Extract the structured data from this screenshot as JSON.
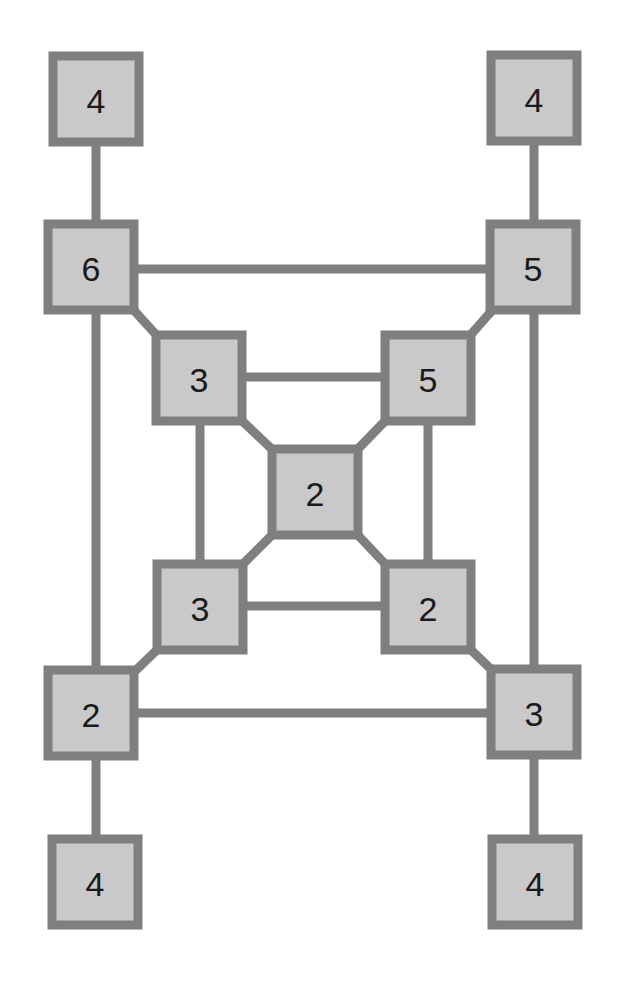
{
  "diagram": {
    "type": "graph",
    "colors": {
      "node_fill": "#c9c9c9",
      "node_border": "#7f7f7f",
      "edge": "#7f7f7f",
      "label": "#1a1a1a",
      "background": "#ffffff"
    },
    "node_size": 86,
    "nodes": [
      {
        "id": "n_tl",
        "label": "4",
        "x": 53,
        "y": 56
      },
      {
        "id": "n_tr",
        "label": "4",
        "x": 491,
        "y": 55
      },
      {
        "id": "n_o6",
        "label": "6",
        "x": 48,
        "y": 224
      },
      {
        "id": "n_o5",
        "label": "5",
        "x": 490,
        "y": 224
      },
      {
        "id": "n_i3a",
        "label": "3",
        "x": 156,
        "y": 335
      },
      {
        "id": "n_i5",
        "label": "5",
        "x": 385,
        "y": 335
      },
      {
        "id": "n_c",
        "label": "2",
        "x": 272,
        "y": 449
      },
      {
        "id": "n_i3b",
        "label": "3",
        "x": 157,
        "y": 564
      },
      {
        "id": "n_i2",
        "label": "2",
        "x": 385,
        "y": 564
      },
      {
        "id": "n_o2",
        "label": "2",
        "x": 48,
        "y": 670
      },
      {
        "id": "n_o3",
        "label": "3",
        "x": 491,
        "y": 669
      },
      {
        "id": "n_bl",
        "label": "4",
        "x": 52,
        "y": 839
      },
      {
        "id": "n_br",
        "label": "4",
        "x": 492,
        "y": 839
      }
    ],
    "edges": [
      {
        "from": "n_tl",
        "to": "n_o6",
        "x1": 96,
        "y1": 142,
        "x2": 96,
        "y2": 224
      },
      {
        "from": "n_tr",
        "to": "n_o5",
        "x1": 534,
        "y1": 141,
        "x2": 534,
        "y2": 224
      },
      {
        "from": "n_o6",
        "to": "n_o5",
        "x1": 134,
        "y1": 269,
        "x2": 490,
        "y2": 269
      },
      {
        "from": "n_o6",
        "to": "n_o2",
        "x1": 96,
        "y1": 310,
        "x2": 96,
        "y2": 670
      },
      {
        "from": "n_o5",
        "to": "n_o3",
        "x1": 534,
        "y1": 310,
        "x2": 534,
        "y2": 669
      },
      {
        "from": "n_o2",
        "to": "n_o3",
        "x1": 134,
        "y1": 713,
        "x2": 491,
        "y2": 713
      },
      {
        "from": "n_o2",
        "to": "n_bl",
        "x1": 96,
        "y1": 756,
        "x2": 96,
        "y2": 839
      },
      {
        "from": "n_o3",
        "to": "n_br",
        "x1": 534,
        "y1": 755,
        "x2": 534,
        "y2": 839
      },
      {
        "from": "n_o6",
        "to": "n_i3a",
        "x1": 130,
        "y1": 306,
        "x2": 160,
        "y2": 339
      },
      {
        "from": "n_o5",
        "to": "n_i5",
        "x1": 496,
        "y1": 306,
        "x2": 467,
        "y2": 339
      },
      {
        "from": "n_o2",
        "to": "n_i3b",
        "x1": 130,
        "y1": 676,
        "x2": 161,
        "y2": 646
      },
      {
        "from": "n_o3",
        "to": "n_i2",
        "x1": 497,
        "y1": 675,
        "x2": 467,
        "y2": 646
      },
      {
        "from": "n_i3a",
        "to": "n_i5",
        "x1": 242,
        "y1": 377,
        "x2": 385,
        "y2": 377
      },
      {
        "from": "n_i3b",
        "to": "n_i2",
        "x1": 243,
        "y1": 606,
        "x2": 385,
        "y2": 606
      },
      {
        "from": "n_i3a",
        "to": "n_i3b",
        "x1": 200,
        "y1": 421,
        "x2": 200,
        "y2": 564
      },
      {
        "from": "n_i5",
        "to": "n_i2",
        "x1": 428,
        "y1": 421,
        "x2": 428,
        "y2": 564
      },
      {
        "from": "n_i3a",
        "to": "n_c",
        "x1": 238,
        "y1": 417,
        "x2": 276,
        "y2": 453
      },
      {
        "from": "n_i5",
        "to": "n_c",
        "x1": 389,
        "y1": 417,
        "x2": 354,
        "y2": 453
      },
      {
        "from": "n_i3b",
        "to": "n_c",
        "x1": 239,
        "y1": 568,
        "x2": 276,
        "y2": 531
      },
      {
        "from": "n_i2",
        "to": "n_c",
        "x1": 389,
        "y1": 568,
        "x2": 354,
        "y2": 531
      }
    ]
  }
}
